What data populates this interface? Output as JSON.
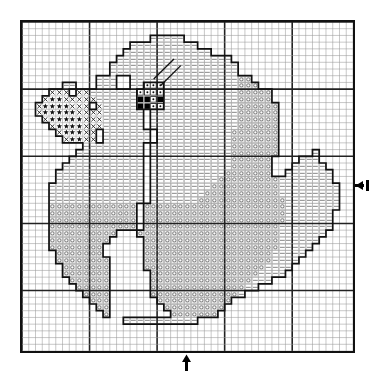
{
  "chart_data": {
    "type": "heatmap",
    "title": "Cross-stitch pattern chart - duck on water",
    "subtitle": "Symbol chart, 49 x 49 stitch grid",
    "xlabel": "",
    "ylabel": "",
    "grid": true,
    "legend_position": "none",
    "grid_cols": 49,
    "grid_rows": 49,
    "heavy_line_interval": 10,
    "cell_size_px": 6.8,
    "axis_ranges": {
      "x": [
        0,
        49
      ],
      "y": [
        0,
        49
      ]
    },
    "symbols": [
      {
        "key": "blank",
        "name": "blank-cell",
        "glyph": "",
        "description": "unstitched background",
        "color": "#ffffff"
      },
      {
        "key": "dash",
        "name": "dash-symbol",
        "glyph": "–",
        "description": "light shade - head and back",
        "color": "#8a8a8a"
      },
      {
        "key": "circle",
        "name": "circle-symbol",
        "glyph": "○",
        "description": "mid shade - body",
        "color": "#8a8a8a"
      },
      {
        "key": "ex",
        "name": "x-symbol",
        "glyph": "X",
        "description": "beak outline shade",
        "color": "#1a1a1a"
      },
      {
        "key": "star",
        "name": "star-symbol",
        "glyph": "★",
        "description": "beak fill - dark",
        "color": "#111111"
      },
      {
        "key": "dot",
        "name": "dot-symbol",
        "glyph": "·",
        "description": "eye highlight",
        "color": "#111111"
      },
      {
        "key": "solid",
        "name": "filled-square-symbol",
        "glyph": "■",
        "description": "eye - solid black",
        "color": "#000000"
      }
    ],
    "markers": [
      {
        "name": "center-marker-right",
        "glyph": "←",
        "edge": "right",
        "row": 24
      },
      {
        "name": "center-marker-bottom",
        "glyph": "↑",
        "edge": "bottom",
        "col": 24
      }
    ],
    "leader_lines": [
      {
        "name": "eye-leader-1",
        "from": [
          19,
          8
        ],
        "to": [
          22,
          5
        ]
      },
      {
        "name": "eye-leader-2",
        "from": [
          20,
          9
        ],
        "to": [
          23,
          6
        ]
      }
    ],
    "rows": [
      ".................................................",
      ".................................................",
      "...................-----.........................",
      "................----------.......................",
      "...............-------------.....................",
      "..............-----------------..................",
      ".............-------------------.................",
      ".............-------------------.................",
      "...........---..----------------oo...............",
      "......--...---..----------------ooo..............",
      "....XXX.XX-------...------------ooooo............",
      "...X**XXXXX-------.-------------ooooo............",
      "..X****XXX.X------.-------------oooooo...........",
      "..X*****XXXX------.-------------oooooo...........",
      "...X*****XXX------.-------------oooooo...........",
      "....X****XXX------.-------------oooooo...........",
      ".....X***XX.-------.-----------ooooooo...........",
      "......X**XX.-------.-----------ooooooo...........",
      ".........---------.------------ooooooo...........",
      "........----------.------------ooooooo.....-.....",
      ".......-----------.------------oooooo....---.....",
      "......------------.------------oooooo...-----....",
      ".....-------------.-----------ooooooo..-------...",
      ".....-------------.----------ooooooooo--------...",
      "....--------------.---------oooooooooo---------..",
      "....--------------.--------ooooooooooo---------..",
      "....--------------.-------ooooooooooooo--------..",
      "....ooooooooooooo.ooooooooooooooooooooo--------..",
      "....ooooooooooooo.ooooooooooooooooooooo-------...",
      "....ooooooooooooo.ooooooooooooooooooooo-------...",
      "....ooooooooooooo.oooooooooooooooooooo--------...",
      "....oooooooooo...ooooooooooooooooooooo-------....",
      "....ooooooooo.....oooooooooooooooooooo------.....",
      "....oooooooo......oooooooooooooooooooo-----......",
      ".....ooooooo......ooooooooooooooooooo-----.......",
      ".....oooooooo.....ooooooooooooooooooo----........",
      "......ooooooo.....oooooooooooooooooo----.........",
      "......ooooooo......oooooooooooooooo----..........",
      ".......oooooo......ooooooooooooooo---............",
      "........ooooo......oooooooooooooo--..............",
      ".........oooo......ooooooooooooo-................",
      "..........ooo.......ooooooooooo..................",
      "...........oo........ooooooooo...................",
      "............o.........ooooooo....................",
      "...............-----------.......................",
      ".................................................",
      ".................................................",
      ".................................................",
      "................................................."
    ]
  },
  "chart": {
    "caption": "Duck cross stitch pattern",
    "units": "stitches"
  }
}
